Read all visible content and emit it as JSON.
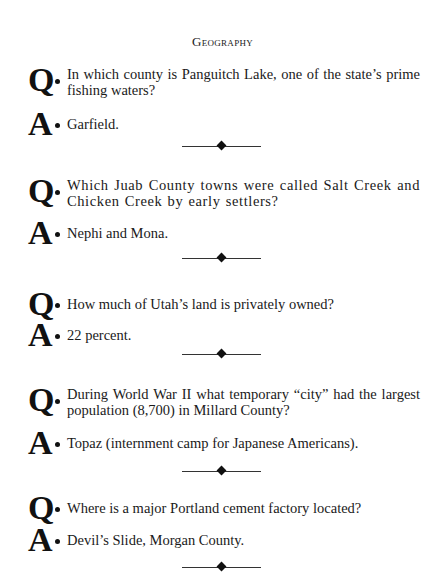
{
  "page": {
    "header": "Geography",
    "items": [
      {
        "q": "In which county is Panguitch Lake, one of the state’s prime fishing waters?",
        "a": "Garfield."
      },
      {
        "q": "Which Juab County towns were called Salt Creek and Chicken Creek by early settlers?",
        "a": "Nephi and Mona."
      },
      {
        "q": "How much of Utah’s land is privately owned?",
        "a": "22 percent."
      },
      {
        "q": "During World War II what temporary “city” had the largest population (8,700) in Millard County?",
        "a": "Topaz (internment camp for Japanese Americans)."
      },
      {
        "q": "Where is a major Portland cement factory located?",
        "a": "Devil’s Slide, Morgan County."
      }
    ],
    "q_letter": "Q",
    "a_letter": "A"
  }
}
